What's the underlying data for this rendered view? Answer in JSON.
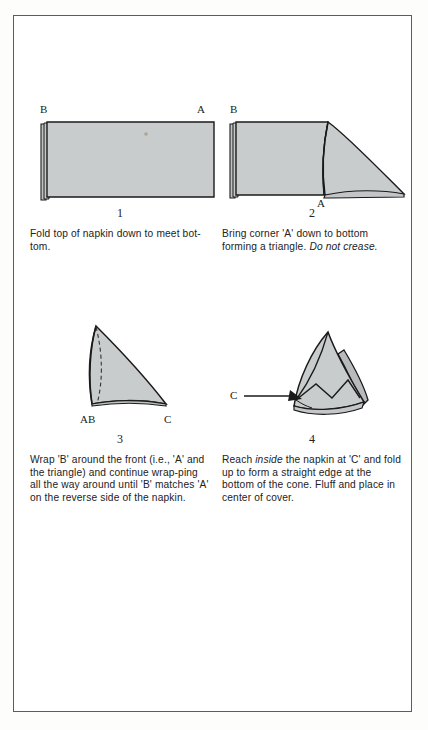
{
  "page": {
    "background_color": "#ffffff",
    "frame_color": "#595c60",
    "napkin_fill": "#c9cccd",
    "napkin_stroke": "#1a1a1a"
  },
  "steps": [
    {
      "number": "1",
      "caption": "Fold top of napkin down to meet bot-tom.",
      "caption_plain": "Fold top of napkin down to meet bottom.",
      "caption_italic": "",
      "figure_name": "folded-rectangle-napkin",
      "labels": [
        {
          "text": "B",
          "position": "top-left"
        },
        {
          "text": "A",
          "position": "top-right"
        }
      ]
    },
    {
      "number": "2",
      "caption_lead": "Bring corner 'A' down to bottom forming a triangle. ",
      "caption_italic": "Do not crease.",
      "caption_plain": "Bring corner 'A' down to bottom forming a triangle. Do not crease.",
      "figure_name": "napkin-with-corner-folded-down",
      "labels": [
        {
          "text": "B",
          "position": "top-left"
        },
        {
          "text": "A",
          "position": "bottom-center"
        }
      ]
    },
    {
      "number": "3",
      "caption": "Wrap 'B' around the front (i.e., 'A' and the triangle) and continue wrap-ping all the way around until 'B' matches 'A' on the reverse side of the napkin.",
      "caption_plain": "Wrap 'B' around the front (i.e., 'A' and the triangle) and continue wrapping all the way around until 'B' matches 'A' on the reverse side of the napkin.",
      "caption_italic": "",
      "figure_name": "curved-triangle-cone",
      "labels": [
        {
          "text": "AB",
          "position": "bottom-left"
        },
        {
          "text": "C",
          "position": "bottom-right"
        }
      ]
    },
    {
      "number": "4",
      "caption_lead_pre": "Reach ",
      "caption_italic": "inside",
      "caption_lead_post": " the napkin at 'C' and fold up to form a straight edge at the bottom of the cone. Fluff and place in center of cover.",
      "caption_plain": "Reach inside the napkin at 'C' and fold up to form a straight edge at the bottom of the cone. Fluff and place in center of cover.",
      "figure_name": "finished-napkin-cone",
      "labels": [
        {
          "text": "C",
          "position": "left-pointer"
        }
      ]
    }
  ]
}
